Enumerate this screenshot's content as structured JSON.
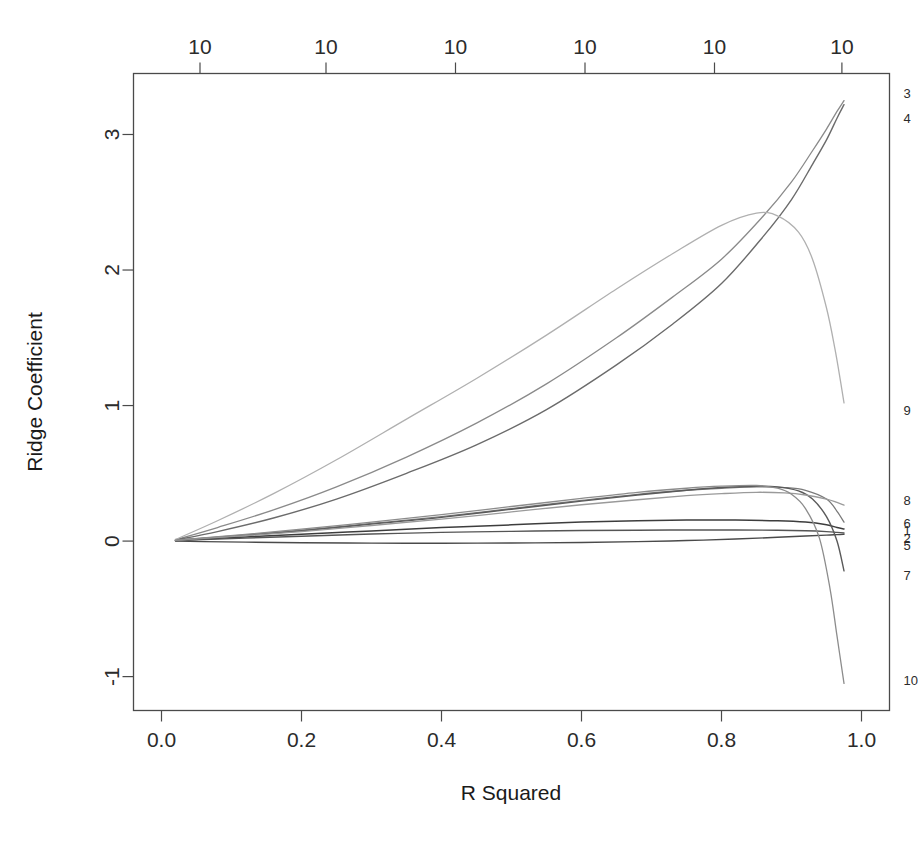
{
  "chart_data": {
    "type": "line",
    "title": "",
    "xlabel": "R Squared",
    "ylabel": "Ridge Coefficient",
    "xlim": [
      -0.04,
      1.04
    ],
    "ylim": [
      -1.25,
      3.45
    ],
    "grid": false,
    "legend": "right-edge-labels",
    "x_ticks": [
      "0.0",
      "0.2",
      "0.4",
      "0.6",
      "0.8",
      "1.0"
    ],
    "x_tick_values": [
      0.0,
      0.2,
      0.4,
      0.6,
      0.8,
      1.0
    ],
    "y_ticks": [
      "-1",
      "0",
      "1",
      "2",
      "3"
    ],
    "y_tick_values": [
      -1,
      0,
      1,
      2,
      3
    ],
    "top_axis": {
      "labels": [
        "10",
        "10",
        "10",
        "10",
        "10",
        "10"
      ],
      "positions": [
        0.055,
        0.235,
        0.42,
        0.605,
        0.79,
        0.972
      ]
    },
    "series": [
      {
        "name": "1",
        "label": "1",
        "color": "#3d3d3d",
        "width": 1.5,
        "label_y": 0.075,
        "x": [
          0.02,
          0.06,
          0.12,
          0.2,
          0.3,
          0.4,
          0.5,
          0.6,
          0.68,
          0.75,
          0.82,
          0.88,
          0.92,
          0.95,
          0.965,
          0.975
        ],
        "y": [
          0.005,
          0.015,
          0.03,
          0.05,
          0.075,
          0.1,
          0.12,
          0.14,
          0.15,
          0.155,
          0.155,
          0.15,
          0.14,
          0.12,
          0.1,
          0.09
        ]
      },
      {
        "name": "2",
        "label": "2",
        "color": "#555555",
        "width": 1.4,
        "label_y": 0.02,
        "x": [
          0.02,
          0.06,
          0.12,
          0.2,
          0.3,
          0.4,
          0.5,
          0.6,
          0.68,
          0.75,
          0.82,
          0.88,
          0.92,
          0.95,
          0.965,
          0.975
        ],
        "y": [
          0.004,
          0.012,
          0.022,
          0.036,
          0.052,
          0.064,
          0.072,
          0.078,
          0.08,
          0.082,
          0.082,
          0.08,
          0.076,
          0.07,
          0.064,
          0.06
        ]
      },
      {
        "name": "3",
        "label": "3",
        "color": "#8a8a8a",
        "width": 1.3,
        "label_y": 3.3,
        "x": [
          0.02,
          0.08,
          0.16,
          0.25,
          0.35,
          0.45,
          0.55,
          0.65,
          0.73,
          0.8,
          0.86,
          0.9,
          0.93,
          0.95,
          0.965,
          0.975
        ],
        "y": [
          0.01,
          0.1,
          0.23,
          0.4,
          0.62,
          0.87,
          1.16,
          1.5,
          1.8,
          2.08,
          2.4,
          2.65,
          2.88,
          3.04,
          3.17,
          3.25
        ]
      },
      {
        "name": "4",
        "label": "4",
        "color": "#6b6b6b",
        "width": 1.4,
        "label_y": 3.12,
        "x": [
          0.02,
          0.08,
          0.16,
          0.25,
          0.35,
          0.45,
          0.55,
          0.65,
          0.73,
          0.8,
          0.86,
          0.9,
          0.93,
          0.95,
          0.965,
          0.975
        ],
        "y": [
          0.008,
          0.07,
          0.17,
          0.31,
          0.5,
          0.71,
          0.97,
          1.3,
          1.6,
          1.9,
          2.25,
          2.52,
          2.78,
          2.96,
          3.12,
          3.22
        ]
      },
      {
        "name": "5",
        "label": "5",
        "color": "#4a4a4a",
        "width": 1.4,
        "label_y": -0.035,
        "x": [
          0.02,
          0.06,
          0.12,
          0.2,
          0.3,
          0.4,
          0.5,
          0.6,
          0.68,
          0.75,
          0.82,
          0.88,
          0.92,
          0.95,
          0.965,
          0.975
        ],
        "y": [
          0.0,
          -0.004,
          -0.008,
          -0.012,
          -0.015,
          -0.016,
          -0.014,
          -0.01,
          -0.004,
          0.004,
          0.015,
          0.028,
          0.038,
          0.044,
          0.048,
          0.05
        ]
      },
      {
        "name": "6",
        "label": "6",
        "color": "#7a7a7a",
        "width": 1.3,
        "label_y": 0.13,
        "x": [
          0.02,
          0.06,
          0.12,
          0.2,
          0.3,
          0.4,
          0.5,
          0.6,
          0.68,
          0.75,
          0.8,
          0.85,
          0.89,
          0.92,
          0.95,
          0.965,
          0.975
        ],
        "y": [
          0.006,
          0.022,
          0.045,
          0.08,
          0.13,
          0.18,
          0.24,
          0.3,
          0.345,
          0.375,
          0.39,
          0.4,
          0.395,
          0.375,
          0.31,
          0.22,
          0.14
        ]
      },
      {
        "name": "7",
        "label": "7",
        "color": "#5a5a5a",
        "width": 1.4,
        "label_y": -0.255,
        "x": [
          0.02,
          0.06,
          0.12,
          0.2,
          0.3,
          0.4,
          0.5,
          0.6,
          0.68,
          0.75,
          0.8,
          0.85,
          0.88,
          0.91,
          0.93,
          0.95,
          0.965,
          0.975
        ],
        "y": [
          0.005,
          0.02,
          0.042,
          0.075,
          0.125,
          0.175,
          0.235,
          0.295,
          0.34,
          0.375,
          0.395,
          0.405,
          0.4,
          0.37,
          0.31,
          0.18,
          0.0,
          -0.22
        ]
      },
      {
        "name": "8",
        "label": "8",
        "color": "#9a9a9a",
        "width": 1.3,
        "label_y": 0.3,
        "x": [
          0.02,
          0.06,
          0.12,
          0.2,
          0.3,
          0.4,
          0.5,
          0.6,
          0.68,
          0.75,
          0.8,
          0.85,
          0.89,
          0.92,
          0.95,
          0.965,
          0.975
        ],
        "y": [
          0.005,
          0.02,
          0.04,
          0.07,
          0.115,
          0.162,
          0.215,
          0.268,
          0.305,
          0.335,
          0.35,
          0.36,
          0.355,
          0.34,
          0.31,
          0.285,
          0.265
        ]
      },
      {
        "name": "9",
        "label": "9",
        "color": "#b0b0b0",
        "width": 1.3,
        "label_y": 0.96,
        "x": [
          0.02,
          0.08,
          0.16,
          0.25,
          0.35,
          0.45,
          0.55,
          0.65,
          0.73,
          0.8,
          0.85,
          0.88,
          0.91,
          0.93,
          0.95,
          0.962,
          0.97,
          0.975
        ],
        "y": [
          0.012,
          0.15,
          0.35,
          0.6,
          0.9,
          1.2,
          1.52,
          1.86,
          2.12,
          2.33,
          2.42,
          2.4,
          2.28,
          2.08,
          1.72,
          1.42,
          1.18,
          1.02
        ]
      },
      {
        "name": "10",
        "label": "10",
        "color": "#8c8c8c",
        "width": 1.3,
        "label_y": -1.03,
        "x": [
          0.02,
          0.06,
          0.12,
          0.2,
          0.3,
          0.4,
          0.5,
          0.6,
          0.68,
          0.75,
          0.8,
          0.85,
          0.88,
          0.9,
          0.92,
          0.94,
          0.955,
          0.965,
          0.975
        ],
        "y": [
          0.006,
          0.024,
          0.05,
          0.088,
          0.14,
          0.195,
          0.255,
          0.315,
          0.36,
          0.39,
          0.405,
          0.41,
          0.39,
          0.345,
          0.24,
          0.02,
          -0.35,
          -0.7,
          -1.05
        ]
      }
    ]
  },
  "axes": {
    "x_axis_title": "R Squared",
    "y_axis_title": "Ridge Coefficient"
  }
}
